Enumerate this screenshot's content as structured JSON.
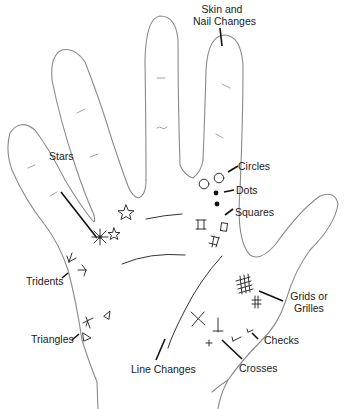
{
  "diagram": {
    "labels": {
      "skin_nail_line1": "Skin and",
      "skin_nail_line2": "Nail Changes",
      "stars": "Stars",
      "circles": "Circles",
      "dots": "Dots",
      "squares": "Squares",
      "tridents": "Tridents",
      "triangles": "Triangles",
      "grids_line1": "Grids or",
      "grids_line2": "Grilles",
      "checks": "Checks",
      "line_changes": "Line Changes",
      "crosses": "Crosses"
    },
    "symbols": [
      "star-icon",
      "circle-icon",
      "dot-icon",
      "square-icon",
      "trident-icon",
      "triangle-icon",
      "grid-icon",
      "check-icon",
      "cross-icon"
    ],
    "colors": {
      "outline": "#8a8a8a",
      "ink": "#111111",
      "background": "#ffffff"
    }
  }
}
